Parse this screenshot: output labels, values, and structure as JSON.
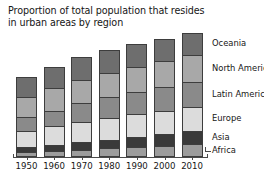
{
  "chart_data": {
    "type": "bar",
    "subtype": "stacked-bar",
    "title": "Proportion of total population that resides\nin urban areas by region",
    "xlabel": "",
    "ylabel": "",
    "grid": false,
    "legend_position": "right",
    "categories": [
      "1950",
      "1960",
      "1970",
      "1980",
      "1990",
      "2000",
      "2010"
    ],
    "series": [
      {
        "name": "Africa",
        "color": "#9c9c9c",
        "values": [
          14,
          18,
          23,
          27,
          31,
          35,
          39
        ]
      },
      {
        "name": "Asia",
        "color": "#3a3a3a",
        "values": [
          17,
          20,
          23,
          26,
          31,
          37,
          43
        ]
      },
      {
        "name": "Europe",
        "color": "#dcdcdc",
        "values": [
          51,
          57,
          63,
          68,
          70,
          71,
          73
        ]
      },
      {
        "name": "Latin America",
        "color": "#8a8a8a",
        "values": [
          41,
          49,
          57,
          65,
          71,
          75,
          79
        ]
      },
      {
        "name": "North America",
        "color": "#a8a8a8",
        "values": [
          64,
          70,
          74,
          74,
          75,
          79,
          82
        ]
      },
      {
        "name": "Oceania",
        "color": "#6e6e6e",
        "values": [
          62,
          66,
          70,
          71,
          71,
          70,
          70
        ]
      }
    ],
    "stack_totals": [
      249,
      280,
      310,
      331,
      349,
      367,
      386
    ],
    "ylim": [
      0,
      400
    ]
  },
  "legend": {
    "items": [
      {
        "label": "Oceania"
      },
      {
        "label": "North America"
      },
      {
        "label": "Latin America"
      },
      {
        "label": "Europe"
      },
      {
        "label": "Asia"
      },
      {
        "label": "Africa"
      }
    ]
  },
  "axis": {
    "tick_labels": [
      "1950",
      "1960",
      "1970",
      "1980",
      "1990",
      "2000",
      "2010"
    ]
  },
  "colors": {
    "axis": "#4a4a4a",
    "outline": "#3d3d3d",
    "text": "#161616",
    "background": "#ffffff"
  }
}
